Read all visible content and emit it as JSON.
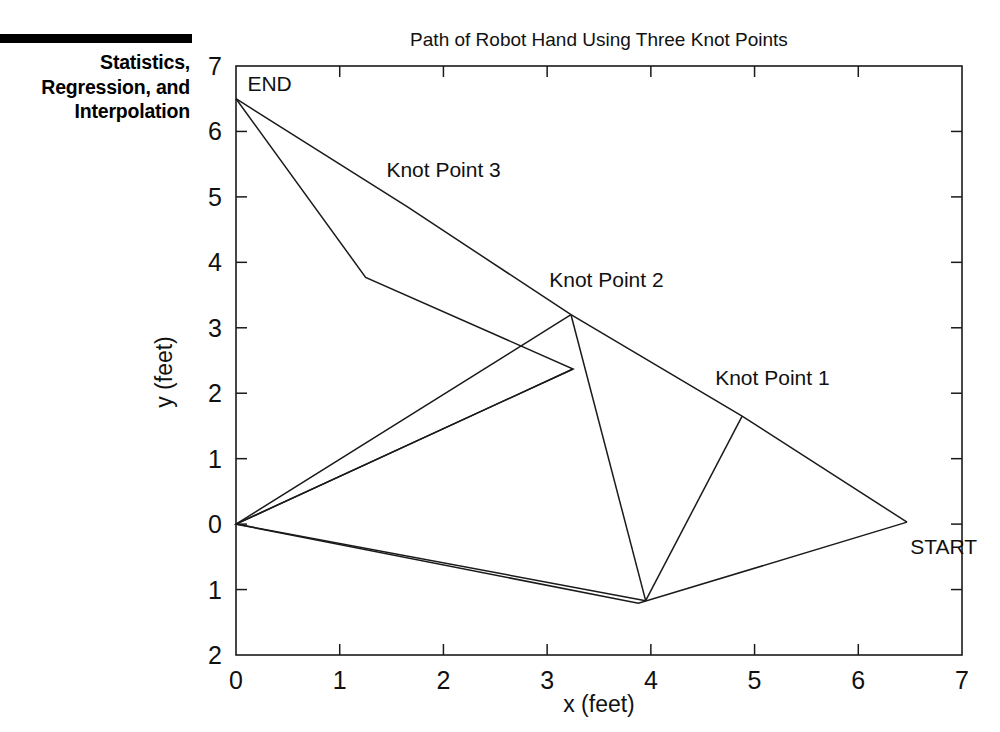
{
  "chapter": {
    "running_head": "Statistics,\nRegression, and\nInterpolation",
    "rule_color": "#000000"
  },
  "figure": {
    "title": "Path of Robot Hand Using Three Knot Points",
    "line_color": "#1a1a1a",
    "frame_color": "#1a1a1a",
    "background": "#ffffff"
  },
  "chart_data": {
    "type": "line",
    "title": "Path of Robot Hand Using Three Knot Points",
    "xlabel": "x (feet)",
    "ylabel": "y (feet)",
    "xlim": [
      0,
      7
    ],
    "ylim": [
      -2,
      7
    ],
    "xticks": [
      0,
      1,
      2,
      3,
      4,
      5,
      6,
      7
    ],
    "xtick_labels": [
      "0",
      "1",
      "2",
      "3",
      "4",
      "5",
      "6",
      "7"
    ],
    "yticks": [
      -2,
      -1,
      0,
      1,
      2,
      3,
      4,
      5,
      6,
      7
    ],
    "ytick_labels": [
      "2",
      "1",
      "0",
      "1",
      "2",
      "3",
      "4",
      "5",
      "6",
      "7"
    ],
    "grid": false,
    "legend": "none",
    "series": [
      {
        "name": "robot-hand-path-outbound",
        "comment": "START -> Knot Point 1 -> Knot Point 2 -> Knot Point 3 -> END",
        "points": [
          [
            6.47,
            0.03
          ],
          [
            4.88,
            1.65
          ],
          [
            3.23,
            3.2
          ],
          [
            1.65,
            4.85
          ],
          [
            0.0,
            6.5
          ]
        ]
      },
      {
        "name": "robot-hand-path-interpolated",
        "comment": "interpolated return path through origin and lower dip",
        "points": [
          [
            0.0,
            6.5
          ],
          [
            1.25,
            3.77
          ],
          [
            3.25,
            2.37
          ],
          [
            0.0,
            0.0
          ],
          [
            3.88,
            -1.21
          ],
          [
            6.47,
            0.03
          ]
        ]
      },
      {
        "name": "robot-hand-path-chords",
        "comment": "straight chords from origin out to knot points and dip",
        "points_segments": [
          [
            [
              0.0,
              0.0
            ],
            [
              3.23,
              3.2
            ]
          ],
          [
            [
              0.0,
              0.0
            ],
            [
              3.25,
              2.37
            ]
          ],
          [
            [
              0.0,
              0.0
            ],
            [
              3.95,
              -1.17
            ]
          ],
          [
            [
              3.23,
              3.2
            ],
            [
              3.95,
              -1.17
            ]
          ],
          [
            [
              3.95,
              -1.17
            ],
            [
              4.88,
              1.65
            ]
          ]
        ]
      }
    ],
    "annotations": [
      {
        "name": "start-label",
        "text": "START",
        "x": 6.5,
        "y": -0.45,
        "anchor": "start"
      },
      {
        "name": "knot-point-1-label",
        "text": "Knot Point 1",
        "x": 4.62,
        "y": 2.12,
        "anchor": "start"
      },
      {
        "name": "knot-point-2-label",
        "text": "Knot Point 2",
        "x": 3.02,
        "y": 3.62,
        "anchor": "start"
      },
      {
        "name": "knot-point-3-label",
        "text": "Knot Point 3",
        "x": 1.45,
        "y": 5.3,
        "anchor": "start"
      },
      {
        "name": "end-label",
        "text": "END",
        "x": 0.11,
        "y": 6.62,
        "anchor": "start"
      }
    ]
  }
}
